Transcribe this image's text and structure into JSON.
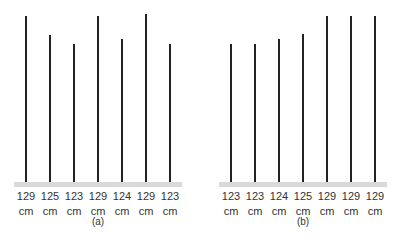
{
  "chart_data": [
    {
      "type": "bar",
      "title": "(a)",
      "unit": "cm",
      "categories": [
        "1",
        "2",
        "3",
        "4",
        "5",
        "6",
        "7"
      ],
      "values": [
        129,
        125,
        123,
        129,
        124,
        129,
        123
      ],
      "labels": [
        "129",
        "125",
        "123",
        "129",
        "124",
        "129",
        "123"
      ]
    },
    {
      "type": "bar",
      "title": "(b)",
      "unit": "cm",
      "categories": [
        "1",
        "2",
        "3",
        "4",
        "5",
        "6",
        "7"
      ],
      "values": [
        123,
        123,
        124,
        125,
        129,
        129,
        129
      ],
      "labels": [
        "123",
        "123",
        "124",
        "125",
        "129",
        "129",
        "129"
      ]
    }
  ],
  "panels": [
    {
      "caption": "(a)",
      "unit": "cm",
      "xs": [
        26,
        50,
        74,
        98,
        122,
        146,
        170
      ],
      "tops": [
        16,
        35,
        44,
        16,
        39,
        14,
        44
      ],
      "labels": [
        "129",
        "125",
        "123",
        "129",
        "124",
        "129",
        "123"
      ]
    },
    {
      "caption": "(b)",
      "unit": "cm",
      "xs": [
        231,
        255,
        279,
        303,
        327,
        351,
        375
      ],
      "tops": [
        44,
        44,
        39,
        34,
        16,
        16,
        16
      ],
      "labels": [
        "123",
        "123",
        "124",
        "125",
        "129",
        "129",
        "129"
      ]
    }
  ]
}
